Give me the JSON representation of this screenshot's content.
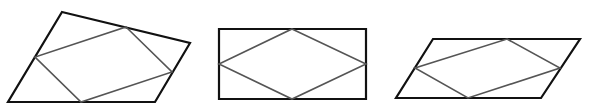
{
  "diagram": {
    "colors": {
      "background": "#ffffff",
      "outer_stroke": "#111111",
      "inner_stroke": "#555555"
    },
    "shapes": [
      {
        "name": "general-quadrilateral",
        "outer": [
          [
            62,
            12
          ],
          [
            190,
            43
          ],
          [
            155,
            102
          ],
          [
            8,
            102
          ]
        ],
        "inner": [
          [
            126,
            27
          ],
          [
            172,
            72
          ],
          [
            81,
            102
          ],
          [
            35,
            57
          ]
        ]
      },
      {
        "name": "rectangle",
        "outer": [
          [
            219,
            29
          ],
          [
            366,
            29
          ],
          [
            366,
            99
          ],
          [
            219,
            99
          ]
        ],
        "inner": [
          [
            292,
            29
          ],
          [
            366,
            64
          ],
          [
            292,
            99
          ],
          [
            219,
            64
          ]
        ]
      },
      {
        "name": "parallelogram",
        "outer": [
          [
            433,
            39
          ],
          [
            580,
            39
          ],
          [
            541,
            98
          ],
          [
            396,
            98
          ]
        ],
        "inner": [
          [
            507,
            39
          ],
          [
            560,
            68
          ],
          [
            468,
            98
          ],
          [
            415,
            68
          ]
        ]
      }
    ]
  }
}
